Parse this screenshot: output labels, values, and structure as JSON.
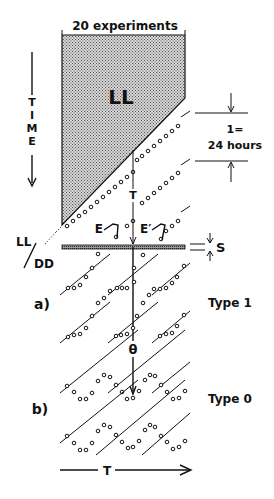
{
  "title": "20 experiments",
  "block_label": "LL",
  "time_axis_label": "TIME",
  "period_label_line1": "1=",
  "period_label_line2": "24 hours",
  "period_T_label": "T",
  "event_labels": {
    "E": "E",
    "E_prime": "E′"
  },
  "stimulus_label": "S",
  "transition_label": {
    "top": "LL",
    "bottom": "DD"
  },
  "panel_a": {
    "label": "a)",
    "type": "Type 1"
  },
  "panel_b": {
    "label": "b)",
    "type": "Type 0"
  },
  "theta_label": "θ",
  "bottom_axis_label": "T",
  "colors": {
    "ink": "#111111",
    "shade": "#bdbdbd",
    "background": "#ffffff"
  }
}
